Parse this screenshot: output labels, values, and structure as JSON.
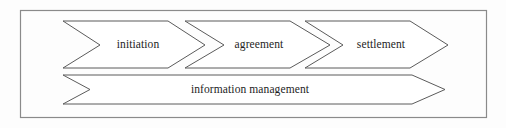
{
  "figure": {
    "kind": "process-flow-chevron-diagram",
    "frame": {
      "border_color": "#8a8a8a",
      "background_color": "#fdfdfd"
    },
    "shape_style": {
      "fill": "#ffffff",
      "stroke": "#5b5b5b"
    }
  },
  "stages": [
    {
      "id": "initiation",
      "label": "initiation",
      "order": 1,
      "points": "63,21 168,21 205,45 168,68 63,68 100,45"
    },
    {
      "id": "agreement",
      "label": "agreement",
      "order": 2,
      "points": "185,21 290,21 330,45 290,68 185,68 224,45"
    },
    {
      "id": "settlement",
      "label": "settlement",
      "order": 3,
      "points": "305,21 410,21 448,45 410,68 305,68 343,45"
    }
  ],
  "stage_label_positions": [
    {
      "x": 138,
      "y": 45
    },
    {
      "x": 259,
      "y": 45
    },
    {
      "x": 381,
      "y": 45
    }
  ],
  "band": {
    "id": "information-management",
    "label": "information management",
    "points": "63,75 412,75 445,89.5 412,104 63,104 90,89.5",
    "label_position": {
      "x": 250,
      "y": 90
    }
  }
}
